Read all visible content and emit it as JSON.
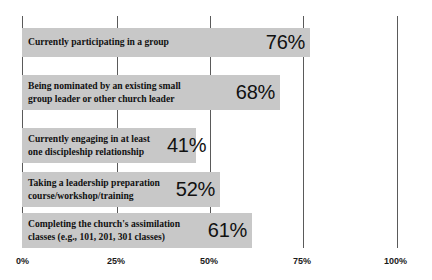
{
  "chart_data": {
    "type": "bar",
    "orientation": "horizontal",
    "title": "",
    "xlabel": "",
    "ylabel": "",
    "xlim": [
      0,
      100
    ],
    "grid": true,
    "legend": false,
    "value_suffix": "%",
    "categories": [
      "Currently participating in a group",
      "Being nominated by an existing small\ngroup leader or other church leader",
      "Currently engaging in at least\none discipleship relationship",
      "Taking a leadership preparation\ncourse/workshop/training",
      "Completing the church's assimilation\nclasses (e.g., 101, 201, 301 classes)"
    ],
    "values": [
      76,
      68,
      41,
      52,
      61
    ],
    "value_labels": [
      "76%",
      "68%",
      "41%",
      "52%",
      "61%"
    ],
    "xticks": [
      0,
      25,
      50,
      75,
      100
    ],
    "xtick_labels": [
      "0%",
      "25%",
      "50%",
      "75%",
      "100%"
    ],
    "colors": {
      "bar_fill": "#c8c8c8",
      "gridline": "#5a5a5a",
      "text": "#111111",
      "background": "#ffffff"
    }
  },
  "bars": [
    {
      "label": "Currently participating in a group",
      "value_label": "76%",
      "top": 28,
      "height": 29,
      "width": 288,
      "label_lines": 1,
      "value_overflow": false
    },
    {
      "label": "Being nominated by an existing small\ngroup leader or other church leader",
      "value_label": "68%",
      "top": 75,
      "height": 35,
      "width": 258,
      "label_lines": 2,
      "value_overflow": false
    },
    {
      "label": "Currently engaging in at least\none discipleship relationship",
      "value_label": "41%",
      "top": 128,
      "height": 35,
      "width": 174,
      "label_lines": 2,
      "value_overflow": true
    },
    {
      "label": "Taking a leadership preparation\ncourse/workshop/training",
      "value_label": "52%",
      "top": 172,
      "height": 35,
      "width": 198,
      "label_lines": 2,
      "value_overflow": false
    },
    {
      "label": "Completing the church's assimilation\nclasses (e.g., 101, 201, 301 classes)",
      "value_label": "61%",
      "top": 213,
      "height": 35,
      "width": 230,
      "label_lines": 2,
      "value_overflow": false
    }
  ],
  "gridlines": [
    {
      "label": "0%",
      "x": 22,
      "label_x": 16
    },
    {
      "label": "25%",
      "x": 117,
      "label_x": 107
    },
    {
      "label": "50%",
      "x": 210,
      "label_x": 200
    },
    {
      "label": "75%",
      "x": 303,
      "label_x": 293
    },
    {
      "label": "100%",
      "x": 397,
      "label_x": 384
    }
  ]
}
